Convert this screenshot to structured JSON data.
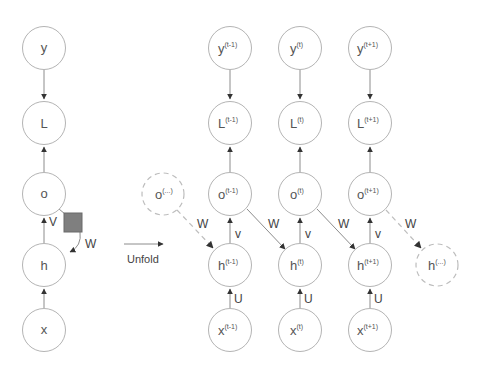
{
  "diagram": {
    "type": "rnn-unfolding",
    "colors": {
      "node_stroke": "#b4b4b4",
      "ghost_stroke": "#bdbdbd",
      "edge": "#8c8c8c",
      "text": "#555555",
      "delay_square": "#7f7f7f"
    },
    "folded": {
      "nodes": [
        {
          "id": "y",
          "label": "y",
          "sup": ""
        },
        {
          "id": "L",
          "label": "L",
          "sup": ""
        },
        {
          "id": "o",
          "label": "o",
          "sup": ""
        },
        {
          "id": "h",
          "label": "h",
          "sup": ""
        },
        {
          "id": "x",
          "label": "x",
          "sup": ""
        }
      ],
      "edge_labels": {
        "V": "V",
        "W": "W"
      }
    },
    "unfold_label": "Unfold",
    "unfolded": {
      "columns": [
        {
          "t": "(t-1)",
          "y": "y",
          "L": "L",
          "o": "o",
          "h": "h",
          "x": "x",
          "v": "v",
          "u": "U"
        },
        {
          "t": "(t)",
          "y": "y",
          "L": "L",
          "o": "o",
          "h": "h",
          "x": "x",
          "v": "v",
          "u": "U"
        },
        {
          "t": "(t+1)",
          "y": "y",
          "L": "L",
          "o": "o",
          "h": "h",
          "x": "x",
          "v": "v",
          "u": "U"
        }
      ],
      "ghost_in": {
        "label": "o",
        "sup": "(...)"
      },
      "ghost_out": {
        "label": "h",
        "sup": "(...)"
      },
      "w_labels": [
        "W",
        "W",
        "W",
        "W"
      ]
    }
  }
}
